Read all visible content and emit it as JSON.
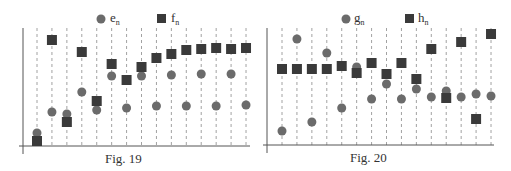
{
  "chart_data": [
    {
      "type": "scatter",
      "title": "",
      "caption": "Fig. 19",
      "xlabel": "",
      "ylabel": "",
      "grid": "vertical dashed lines at each n",
      "legend_position": "top",
      "x": [
        1,
        2,
        3,
        4,
        5,
        6,
        7,
        8,
        9,
        10,
        11,
        12,
        13,
        14,
        15
      ],
      "series": [
        {
          "name": "e",
          "subscript": "n",
          "marker": "circle",
          "color": "#6b6b6b",
          "pixel_y": [
            133,
            112,
            114,
            92,
            110,
            76,
            108,
            76,
            106,
            75,
            106,
            74,
            106,
            74,
            105
          ]
        },
        {
          "name": "f",
          "subscript": "n",
          "marker": "square",
          "color": "#3a3a3a",
          "pixel_y": [
            141,
            40,
            122,
            52,
            101,
            64,
            80,
            67,
            58,
            54,
            50,
            49,
            48,
            49,
            48
          ]
        }
      ],
      "layout": {
        "axis_x0": 23,
        "axis_y0": 146,
        "x_start": 37,
        "x_step": 14.93,
        "top": 28,
        "right": 250
      }
    },
    {
      "type": "scatter",
      "title": "",
      "caption": "Fig. 20",
      "xlabel": "",
      "ylabel": "",
      "grid": "vertical dashed lines at each n",
      "legend_position": "top",
      "x": [
        1,
        2,
        3,
        4,
        5,
        6,
        7,
        8,
        9,
        10,
        11,
        12,
        13,
        14,
        15
      ],
      "series": [
        {
          "name": "g",
          "subscript": "n",
          "marker": "circle",
          "color": "#6b6b6b",
          "pixel_y": [
            131,
            39,
            122,
            53,
            108,
            67,
            99,
            84,
            99,
            89,
            97,
            91,
            97,
            94,
            96
          ]
        },
        {
          "name": "h",
          "subscript": "n",
          "marker": "square",
          "color": "#3a3a3a",
          "pixel_y": [
            69,
            69,
            69,
            69,
            66,
            73,
            63,
            74,
            63,
            79,
            49,
            98,
            42,
            119,
            34
          ]
        }
      ],
      "layout": {
        "axis_x0": 267,
        "axis_y0": 145,
        "x_start": 282,
        "x_step": 14.93,
        "top": 28,
        "right": 494
      }
    }
  ],
  "figures": [
    {
      "caption": "Fig. 19",
      "legend": [
        {
          "label": "e",
          "sub": "n"
        },
        {
          "label": "f",
          "sub": "n"
        }
      ]
    },
    {
      "caption": "Fig. 20",
      "legend": [
        {
          "label": "g",
          "sub": "n"
        },
        {
          "label": "h",
          "sub": "n"
        }
      ]
    }
  ]
}
